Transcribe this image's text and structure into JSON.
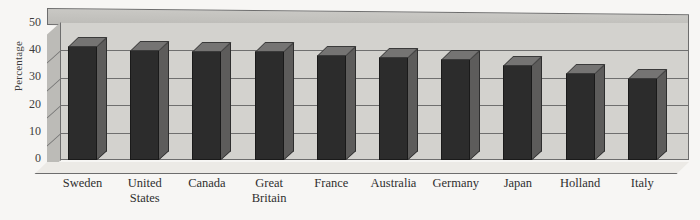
{
  "chart_data": {
    "type": "bar",
    "title": "",
    "subtitle": "",
    "xlabel": "",
    "ylabel": "Percentage",
    "ylim": [
      0,
      50
    ],
    "ytick_step": 10,
    "yticks": [
      50,
      40,
      30,
      20,
      10,
      0
    ],
    "grid": true,
    "legend": "none",
    "style": "3d-column",
    "categories": [
      "Sweden",
      "United States",
      "Canada",
      "Great Britain",
      "France",
      "Australia",
      "Germany",
      "Japan",
      "Holland",
      "Italy"
    ],
    "values": [
      42,
      40.5,
      40,
      40,
      38.5,
      38,
      37,
      35,
      32,
      30
    ],
    "colors": {
      "bar_front": "#2c2c2c",
      "bar_top": "#757473",
      "bar_side": "#5d5c5b",
      "back_wall": "#d3d2ce",
      "side_wall": "#bcbbb7",
      "ceiling": "#c9c8c4",
      "gridline": "#6f6f6f",
      "background": "#f7f6f4",
      "text": "#3a3a3a"
    }
  },
  "axis": {
    "y_title": "Percentage",
    "y_tick_labels": [
      "50",
      "40",
      "30",
      "20",
      "10",
      "0"
    ]
  },
  "categories_multiline": [
    [
      "Sweden"
    ],
    [
      "United",
      "States"
    ],
    [
      "Canada"
    ],
    [
      "Great",
      "Britain"
    ],
    [
      "France"
    ],
    [
      "Australia"
    ],
    [
      "Germany"
    ],
    [
      "Japan"
    ],
    [
      "Holland"
    ],
    [
      "Italy"
    ]
  ]
}
